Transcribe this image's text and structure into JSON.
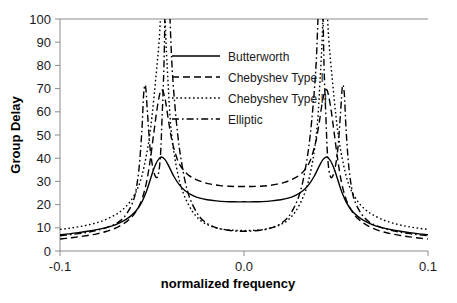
{
  "chart_data": {
    "type": "line",
    "title": "",
    "xlabel": "normalized frequency",
    "ylabel": "Group Delay",
    "xlim": [
      -0.1,
      0.1
    ],
    "ylim": [
      0,
      100
    ],
    "xticks": [
      -0.1,
      0.0,
      0.1
    ],
    "xtick_labels": [
      "-0.1",
      "0.0",
      "0.1"
    ],
    "yticks": [
      0,
      10,
      20,
      30,
      40,
      50,
      60,
      70,
      80,
      90,
      100
    ],
    "ytick_labels": [
      "0",
      "10",
      "20",
      "30",
      "40",
      "50",
      "60",
      "70",
      "80",
      "90",
      "100"
    ],
    "grid": false,
    "legend_position": "upper-center",
    "legend_entries": [
      {
        "label": "Butterworth",
        "style": "solid"
      },
      {
        "label": "Chebyshev Type I",
        "style": "dashed"
      },
      {
        "label": "Chebyshev Type II",
        "style": "dotted"
      },
      {
        "label": "Elliptic",
        "style": "dash-dot"
      }
    ],
    "series": [
      {
        "name": "Butterworth",
        "style": "solid",
        "x": [
          -0.1,
          -0.095,
          -0.09,
          -0.085,
          -0.08,
          -0.075,
          -0.07,
          -0.065,
          -0.062,
          -0.059,
          -0.056,
          -0.053,
          -0.051,
          -0.049,
          -0.047,
          -0.045,
          -0.043,
          -0.041,
          -0.038,
          -0.035,
          -0.032,
          -0.028,
          -0.024,
          -0.02,
          -0.015,
          -0.01,
          -0.005,
          0.0,
          0.005,
          0.01,
          0.015,
          0.02,
          0.024,
          0.028,
          0.032,
          0.035,
          0.038,
          0.041,
          0.043,
          0.045,
          0.047,
          0.049,
          0.051,
          0.053,
          0.056,
          0.059,
          0.062,
          0.065,
          0.07,
          0.075,
          0.08,
          0.085,
          0.09,
          0.095,
          0.1
        ],
        "y": [
          7.0,
          7.4,
          7.9,
          8.5,
          9.2,
          10.1,
          11.3,
          13.2,
          14.8,
          17.0,
          20.4,
          25.8,
          30.6,
          35.4,
          38.9,
          40.5,
          39.5,
          36.8,
          32.0,
          28.4,
          26.0,
          24.0,
          22.8,
          22.1,
          21.6,
          21.3,
          21.2,
          21.2,
          21.2,
          21.3,
          21.6,
          22.1,
          22.8,
          24.0,
          26.0,
          28.4,
          32.0,
          36.8,
          39.5,
          40.5,
          38.9,
          35.4,
          30.6,
          25.8,
          20.4,
          17.0,
          14.8,
          13.2,
          11.3,
          10.1,
          9.2,
          8.5,
          7.9,
          7.4,
          7.0
        ]
      },
      {
        "name": "Chebyshev Type I",
        "style": "dashed",
        "x": [
          -0.1,
          -0.095,
          -0.09,
          -0.085,
          -0.08,
          -0.075,
          -0.07,
          -0.066,
          -0.063,
          -0.06,
          -0.057,
          -0.055,
          -0.053,
          -0.051,
          -0.049,
          -0.047,
          -0.045,
          -0.043,
          -0.041,
          -0.039,
          -0.036,
          -0.033,
          -0.03,
          -0.026,
          -0.022,
          -0.018,
          -0.013,
          -0.008,
          -0.004,
          0.0,
          0.004,
          0.008,
          0.013,
          0.018,
          0.022,
          0.026,
          0.03,
          0.033,
          0.036,
          0.039,
          0.041,
          0.043,
          0.045,
          0.047,
          0.049,
          0.051,
          0.053,
          0.055,
          0.057,
          0.06,
          0.063,
          0.066,
          0.07,
          0.075,
          0.08,
          0.085,
          0.09,
          0.095,
          0.1
        ],
        "y": [
          5.2,
          5.6,
          6.1,
          6.7,
          7.4,
          8.4,
          9.8,
          11.5,
          13.2,
          15.6,
          19.4,
          23.4,
          29.6,
          39.0,
          51.0,
          62.5,
          69.5,
          66.0,
          56.0,
          47.0,
          39.0,
          35.0,
          32.6,
          30.8,
          29.6,
          28.8,
          28.2,
          27.9,
          27.8,
          27.8,
          27.8,
          27.9,
          28.2,
          28.8,
          29.6,
          30.8,
          32.6,
          35.0,
          39.0,
          47.0,
          56.0,
          66.0,
          69.5,
          62.5,
          51.0,
          39.0,
          29.6,
          23.4,
          19.4,
          15.6,
          13.2,
          11.5,
          9.8,
          8.4,
          7.4,
          6.7,
          6.1,
          5.6,
          5.2
        ]
      },
      {
        "name": "Chebyshev Type II",
        "style": "dotted",
        "x": [
          -0.1,
          -0.095,
          -0.09,
          -0.085,
          -0.08,
          -0.075,
          -0.07,
          -0.066,
          -0.062,
          -0.058,
          -0.055,
          -0.052,
          -0.05,
          -0.048,
          -0.046,
          -0.0445,
          -0.0435,
          -0.0425,
          -0.0415,
          -0.04,
          -0.038,
          -0.035,
          -0.032,
          -0.028,
          -0.024,
          -0.02,
          -0.015,
          -0.01,
          -0.005,
          0.0,
          0.005,
          0.01,
          0.015,
          0.02,
          0.024,
          0.028,
          0.032,
          0.035,
          0.038,
          0.04,
          0.0415,
          0.0425,
          0.0435,
          0.0445,
          0.046,
          0.048,
          0.05,
          0.052,
          0.055,
          0.058,
          0.062,
          0.066,
          0.07,
          0.075,
          0.08,
          0.085,
          0.09,
          0.095,
          0.1
        ],
        "y": [
          9.3,
          9.8,
          10.4,
          11.2,
          12.2,
          13.6,
          15.6,
          17.8,
          21.2,
          26.6,
          34.0,
          46.0,
          58.0,
          74.0,
          92.0,
          100.0,
          100.0,
          92.0,
          76.0,
          56.0,
          42.0,
          30.0,
          23.0,
          17.0,
          13.4,
          11.4,
          10.0,
          9.2,
          8.9,
          8.8,
          8.9,
          9.2,
          10.0,
          11.4,
          13.4,
          17.0,
          23.0,
          30.0,
          42.0,
          56.0,
          76.0,
          92.0,
          100.0,
          100.0,
          92.0,
          74.0,
          58.0,
          46.0,
          34.0,
          26.6,
          21.2,
          17.8,
          15.6,
          13.6,
          12.2,
          11.2,
          10.4,
          9.8,
          9.3
        ]
      },
      {
        "name": "Elliptic",
        "style": "dash-dot",
        "x": [
          -0.1,
          -0.095,
          -0.09,
          -0.085,
          -0.08,
          -0.075,
          -0.07,
          -0.067,
          -0.064,
          -0.061,
          -0.059,
          -0.057,
          -0.0555,
          -0.0545,
          -0.0535,
          -0.0525,
          -0.051,
          -0.049,
          -0.047,
          -0.0455,
          -0.0445,
          -0.0435,
          -0.0425,
          -0.041,
          -0.039,
          -0.036,
          -0.033,
          -0.03,
          -0.026,
          -0.022,
          -0.017,
          -0.012,
          -0.006,
          0.0,
          0.006,
          0.012,
          0.017,
          0.022,
          0.026,
          0.03,
          0.033,
          0.036,
          0.039,
          0.041,
          0.0425,
          0.0435,
          0.0445,
          0.0455,
          0.047,
          0.049,
          0.051,
          0.0525,
          0.0535,
          0.0545,
          0.0555,
          0.057,
          0.059,
          0.061,
          0.064,
          0.067,
          0.07,
          0.075,
          0.08,
          0.085,
          0.09,
          0.095,
          0.1
        ],
        "y": [
          6.6,
          7.0,
          7.5,
          8.1,
          8.9,
          10.0,
          11.6,
          13.2,
          15.8,
          20.0,
          25.0,
          36.0,
          52.0,
          68.0,
          71.0,
          60.0,
          44.0,
          34.0,
          32.0,
          40.0,
          58.0,
          80.0,
          100.0,
          100.0,
          78.0,
          50.0,
          34.0,
          24.0,
          17.0,
          13.0,
          10.6,
          9.4,
          8.7,
          8.5,
          8.7,
          9.4,
          10.6,
          13.0,
          17.0,
          24.0,
          34.0,
          50.0,
          78.0,
          100.0,
          100.0,
          80.0,
          58.0,
          40.0,
          32.0,
          34.0,
          44.0,
          60.0,
          71.0,
          68.0,
          52.0,
          36.0,
          25.0,
          20.0,
          15.8,
          13.2,
          11.6,
          10.0,
          8.9,
          8.1,
          7.5,
          7.0,
          6.6
        ]
      }
    ]
  },
  "colors": {
    "curve": "#000000",
    "axis": "#8a8a8a",
    "background": "#ffffff"
  }
}
